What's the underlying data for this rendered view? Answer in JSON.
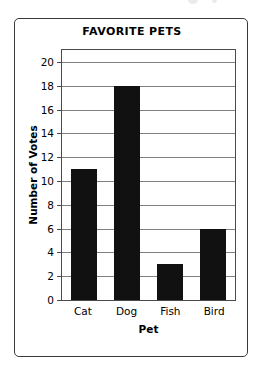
{
  "chart_data": {
    "type": "bar",
    "title": "FAVORITE PETS",
    "xlabel": "Pet",
    "ylabel": "Number of Votes",
    "categories": [
      "Cat",
      "Dog",
      "Fish",
      "Bird"
    ],
    "values": [
      11,
      18,
      3,
      6
    ],
    "ylim": [
      0,
      21
    ],
    "ytick_values": [
      0,
      2,
      4,
      6,
      8,
      10,
      12,
      14,
      16,
      18,
      20
    ],
    "ytick_labels": [
      "0",
      "2",
      "4",
      "6",
      "8",
      "10",
      "12",
      "14",
      "16",
      "18",
      "20"
    ],
    "grid": true,
    "legend": false,
    "bar_color": "#111111",
    "grid_color": "#808080",
    "axis_color": "#4a4a4a",
    "frame_color": "#3a3a3a",
    "background": "#ffffff"
  }
}
